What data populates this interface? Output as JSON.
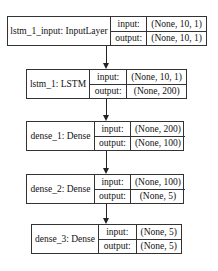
{
  "diagram": {
    "type": "keras-model-plot",
    "nodes": [
      {
        "label": "lstm_1_input: InputLayer",
        "input_label": "input:",
        "output_label": "output:",
        "input": "(None, 10, 1)",
        "output": "(None, 10, 1)"
      },
      {
        "label": "lstm_1: LSTM",
        "input_label": "input:",
        "output_label": "output:",
        "input": "(None, 10, 1)",
        "output": "(None, 200)"
      },
      {
        "label": "dense_1: Dense",
        "input_label": "input:",
        "output_label": "output:",
        "input": "(None, 200)",
        "output": "(None, 100)"
      },
      {
        "label": "dense_2: Dense",
        "input_label": "input:",
        "output_label": "output:",
        "input": "(None, 100)",
        "output": "(None, 5)"
      },
      {
        "label": "dense_3: Dense",
        "input_label": "input:",
        "output_label": "output:",
        "input": "(None, 5)",
        "output": "(None, 5)"
      }
    ],
    "edges": [
      {
        "from": "lstm_1_input",
        "to": "lstm_1"
      },
      {
        "from": "lstm_1",
        "to": "dense_1"
      },
      {
        "from": "dense_1",
        "to": "dense_2"
      },
      {
        "from": "dense_2",
        "to": "dense_3"
      }
    ]
  }
}
